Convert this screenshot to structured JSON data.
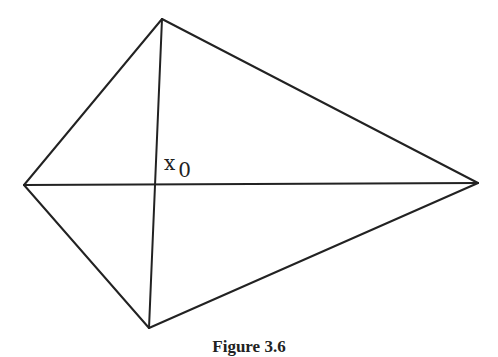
{
  "figure": {
    "caption": "Figure 3.6",
    "point_label": "x",
    "point_subscript": "0",
    "colors": {
      "stroke": "#222222",
      "background": "#ffffff"
    },
    "vertices": {
      "top": [
        162,
        19
      ],
      "bottom": [
        149,
        328
      ],
      "left": [
        24,
        185
      ],
      "right": [
        478,
        183
      ]
    },
    "intersection": [
      155,
      184
    ]
  }
}
